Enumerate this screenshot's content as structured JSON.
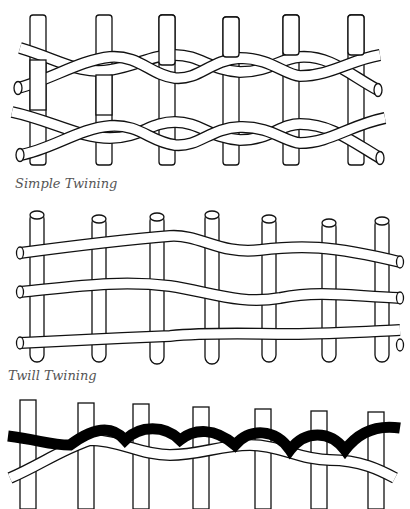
{
  "figures": [
    {
      "id": "simple",
      "label": "Simple Twining",
      "warps": 6,
      "weft_rows": 2
    },
    {
      "id": "twill",
      "label": "Twill Twining",
      "warps": 7,
      "weft_rows": 3
    },
    {
      "id": "bottom",
      "label": "",
      "warps": 7,
      "weft_rows": 1,
      "note": "two-color twining (black and white weft)"
    }
  ],
  "colors": {
    "line": "#111111",
    "fill": "#ffffff",
    "label": "#555555",
    "dark_weft": "#000000"
  }
}
